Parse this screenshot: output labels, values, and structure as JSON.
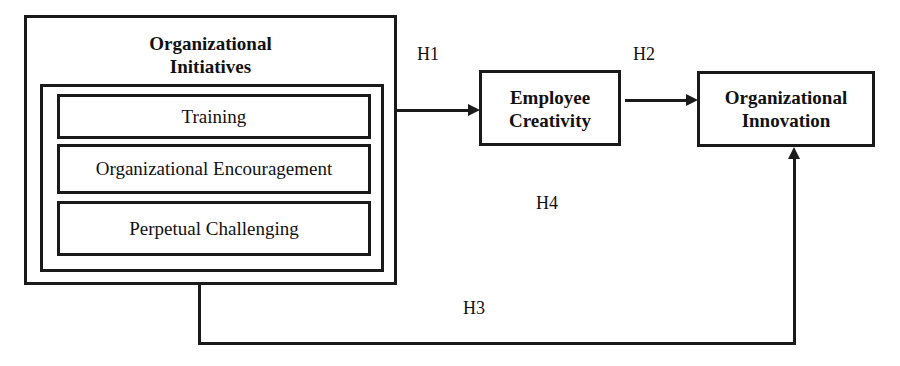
{
  "diagram": {
    "initiatives": {
      "title_line1": "Organizational",
      "title_line2": "Initiatives",
      "components": [
        "Training",
        "Organizational Encouragement",
        "Perpetual Challenging"
      ]
    },
    "creativity": {
      "line1": "Employee",
      "line2": "Creativity"
    },
    "innovation": {
      "line1": "Organizational",
      "line2": "Innovation"
    },
    "hypotheses": {
      "h1": "H1",
      "h2": "H2",
      "h3": "H3",
      "h4": "H4"
    }
  }
}
